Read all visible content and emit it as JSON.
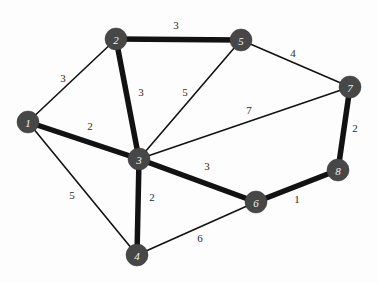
{
  "figure": {
    "background_color": "#fdfdfd",
    "node_color": "#474747",
    "node_label_color": "#f2f2f2",
    "edge_color": "#121212",
    "weight_label_color": "#2b2b2b",
    "width": 378,
    "height": 283
  },
  "chart_data": {
    "type": "diagram",
    "graph_type": "weighted-undirected-graph",
    "node_count": 8,
    "edge_count": 13,
    "nodes": [
      {
        "id": "1",
        "label": "1",
        "x": 28,
        "y": 122,
        "r": 11
      },
      {
        "id": "2",
        "label": "2",
        "x": 116,
        "y": 39,
        "r": 11
      },
      {
        "id": "3",
        "label": "3",
        "x": 139,
        "y": 159,
        "r": 11
      },
      {
        "id": "4",
        "label": "4",
        "x": 137,
        "y": 255,
        "r": 11
      },
      {
        "id": "5",
        "label": "5",
        "x": 241,
        "y": 40,
        "r": 11
      },
      {
        "id": "6",
        "label": "6",
        "x": 256,
        "y": 202,
        "r": 11
      },
      {
        "id": "7",
        "label": "7",
        "x": 350,
        "y": 87,
        "r": 11
      },
      {
        "id": "8",
        "label": "8",
        "x": 338,
        "y": 170,
        "r": 11
      }
    ],
    "edges": [
      {
        "source": "1",
        "target": "2",
        "weight": "3",
        "thick": false,
        "label_x": 63,
        "label_y": 78
      },
      {
        "source": "1",
        "target": "3",
        "weight": "2",
        "thick": true,
        "label_x": 90,
        "label_y": 126
      },
      {
        "source": "1",
        "target": "4",
        "weight": "5",
        "thick": false,
        "label_x": 72,
        "label_y": 195
      },
      {
        "source": "2",
        "target": "3",
        "weight": "3",
        "thick": true,
        "label_x": 141,
        "label_y": 92
      },
      {
        "source": "2",
        "target": "5",
        "weight": "3",
        "thick": true,
        "label_x": 176,
        "label_y": 25
      },
      {
        "source": "3",
        "target": "4",
        "weight": "2",
        "thick": true,
        "label_x": 152,
        "label_y": 197
      },
      {
        "source": "3",
        "target": "5",
        "weight": "5",
        "thick": false,
        "label_x": 185,
        "label_y": 92
      },
      {
        "source": "3",
        "target": "6",
        "weight": "3",
        "thick": true,
        "label_x": 207,
        "label_y": 166
      },
      {
        "source": "3",
        "target": "7",
        "weight": "7",
        "thick": false,
        "label_x": 249,
        "label_y": 110
      },
      {
        "source": "4",
        "target": "6",
        "weight": "6",
        "thick": false,
        "label_x": 200,
        "label_y": 238
      },
      {
        "source": "5",
        "target": "7",
        "weight": "4",
        "thick": false,
        "label_x": 293,
        "label_y": 53
      },
      {
        "source": "6",
        "target": "8",
        "weight": "1",
        "thick": true,
        "label_x": 297,
        "label_y": 199
      },
      {
        "source": "7",
        "target": "8",
        "weight": "2",
        "thick": true,
        "label_x": 355,
        "label_y": 128
      }
    ],
    "stroke_width_thin": 1.6,
    "stroke_width_thick": 5.5
  }
}
